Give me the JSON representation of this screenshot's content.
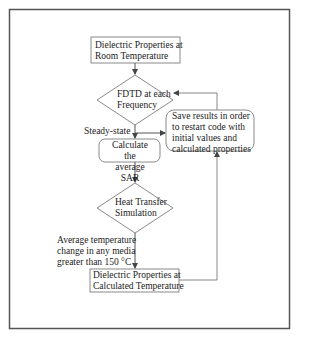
{
  "colors": {
    "stroke": "#7a7a7a",
    "frame": "#555555",
    "text": "#222222",
    "background": "#ffffff"
  },
  "nodes": {
    "room_temp": {
      "type": "rect",
      "line1": "Dielectric Properties at",
      "line2": "Room Temperature"
    },
    "fdtd": {
      "type": "diamond",
      "line1": "FDTD at each",
      "line2": "Frequency"
    },
    "save": {
      "type": "rounded-rect",
      "line1": "Save results in order",
      "line2": "to restart code with",
      "line3": "initial values and",
      "line4": "calculated properties"
    },
    "sar": {
      "type": "rounded-rect",
      "line1": "Calculate the",
      "line2": "average SAR"
    },
    "heat": {
      "type": "diamond",
      "line1": "Heat Transfer",
      "line2": "Simulation"
    },
    "calc_temp": {
      "type": "rect",
      "line1": "Dielectric Properties at",
      "line2": "Calculated Temperature"
    }
  },
  "edge_labels": {
    "steady_state": "Steady-state",
    "temp_change_1": "Average temperature",
    "temp_change_2": "change in any media",
    "temp_change_3": "greater than 150 °C"
  }
}
